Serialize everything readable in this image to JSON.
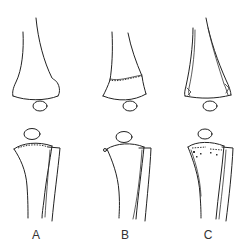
{
  "figure": {
    "type": "anatomical line drawing",
    "rows": [
      "femur with patella (top)",
      "tibia and fibula with patella (bottom)"
    ],
    "panels": [
      {
        "id": "A",
        "label": "A",
        "description": "intact distal femur, tibia plateau with dashed surface line"
      },
      {
        "id": "B",
        "label": "B",
        "description": "transverse fracture line across distal femur; small nodule on tibia"
      },
      {
        "id": "C",
        "label": "C",
        "description": "oblique split lines in femur; speckled tibial plateau"
      }
    ],
    "stroke_color": "#222222",
    "background": "#ffffff"
  }
}
